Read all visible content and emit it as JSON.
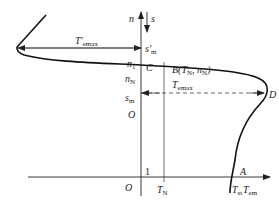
{
  "diagram": {
    "type": "torque-speed characteristic",
    "axes": {
      "vertical_up_label": "n",
      "vertical_down_label": "s",
      "horizontal_label": "T",
      "horizontal_label_sub": "em",
      "origin_label": "O"
    },
    "levels": {
      "n1": {
        "main": "n",
        "sub": "1"
      },
      "nN": {
        "main": "n",
        "sub": "N"
      },
      "sm": {
        "main": "s",
        "sub": "m"
      },
      "sm_prime": {
        "main": "s′",
        "sub": "m"
      },
      "one": "1"
    },
    "points": {
      "C": "C",
      "B": {
        "main": "B(T",
        "sub1": "N",
        "mid": ", n",
        "sub2": "N",
        "end": ")"
      },
      "D": "D",
      "A": "A"
    },
    "torques": {
      "TN": {
        "main": "T",
        "sub": "N"
      },
      "Tst": {
        "main": "T",
        "sub": "st"
      },
      "Temax": {
        "main": "T",
        "sub": "emax"
      },
      "Temax_prime": {
        "main": "T′",
        "sub": "emax"
      }
    },
    "colors": {
      "line": "#222222",
      "background": "#ffffff"
    }
  }
}
